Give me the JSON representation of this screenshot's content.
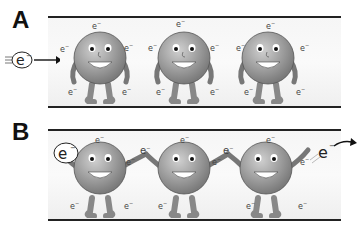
{
  "panels": [
    {
      "label": "A",
      "description": "Isolated atoms with free electrons; incoming electron arrives from left"
    },
    {
      "label": "B",
      "description": "Atoms holding hands passing electrons along; electron exits right"
    }
  ],
  "electron_symbol": "e",
  "electron_charge": "−",
  "incoming_electron": "e−",
  "outgoing_electron": "e−"
}
